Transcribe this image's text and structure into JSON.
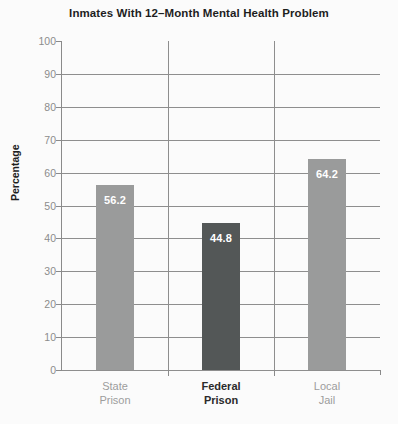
{
  "chart_data": {
    "type": "bar",
    "title": "Inmates With 12–Month Mental Health Problem",
    "xlabel": "",
    "ylabel": "Percentage",
    "categories": [
      "State Prison",
      "Federal Prison",
      "Local Jail"
    ],
    "category_lines": [
      [
        "State",
        "Prison"
      ],
      [
        "Federal",
        "Prison"
      ],
      [
        "Local",
        "Jail"
      ]
    ],
    "values": [
      56.2,
      44.8,
      64.2
    ],
    "value_labels": [
      "56.2",
      "44.8",
      "64.2"
    ],
    "ylim": [
      0,
      100
    ],
    "yticks": [
      0,
      10,
      20,
      30,
      40,
      50,
      60,
      70,
      80,
      90,
      100
    ],
    "ytick_labels": [
      "0",
      "10",
      "20",
      "30",
      "40",
      "50",
      "60",
      "70",
      "80",
      "90",
      "100"
    ],
    "grid": true,
    "grid_axis": "both",
    "legend": "none",
    "bar_colors": [
      "#9a9b9b",
      "#535757",
      "#9a9b9b"
    ],
    "highlighted_category": "Federal Prison"
  },
  "style": {
    "background": "#fbfbfb",
    "axis_color": "#8a8a8a",
    "gridline_color": "#8e8e8e",
    "tick_label_color": "#8c8c8c",
    "title_color": "#1e1e1e",
    "value_label_color": "#ffffff",
    "category_label_color": "#9d9d9d",
    "category_highlight_color": "#2b2b2b"
  }
}
